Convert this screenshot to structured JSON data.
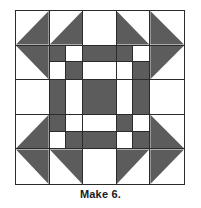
{
  "figure": {
    "caption": "Make 6.",
    "colors": {
      "dark_fabric": "#5c5c5c",
      "light_fabric": "#ffffff",
      "seam_line": "#2b2b2b",
      "background": "#ffffff"
    },
    "block": {
      "name": "quilt-block-diagram",
      "grid_rows": 5,
      "grid_columns": 5,
      "cells": [
        {
          "row": 1,
          "col": 1,
          "type": "half-square-triangle",
          "dark_corner": "bottom-right"
        },
        {
          "row": 1,
          "col": 2,
          "type": "half-square-triangle",
          "dark_corner": "bottom-right"
        },
        {
          "row": 1,
          "col": 3,
          "type": "plain",
          "value": "light"
        },
        {
          "row": 1,
          "col": 4,
          "type": "half-square-triangle",
          "dark_corner": "bottom-left"
        },
        {
          "row": 1,
          "col": 5,
          "type": "half-square-triangle",
          "dark_corner": "bottom-left"
        },
        {
          "row": 2,
          "col": 1,
          "type": "half-square-triangle",
          "dark_corner": "top-right"
        },
        {
          "row": 2,
          "col": 2,
          "type": "four-patch",
          "values": [
            "dark",
            "light",
            "light",
            "dark"
          ]
        },
        {
          "row": 2,
          "col": 3,
          "type": "split-vertical",
          "values": [
            "dark",
            "light"
          ]
        },
        {
          "row": 2,
          "col": 4,
          "type": "four-patch",
          "values": [
            "dark",
            "light",
            "light",
            "dark"
          ]
        },
        {
          "row": 2,
          "col": 5,
          "type": "half-square-triangle",
          "dark_corner": "top-left"
        },
        {
          "row": 3,
          "col": 1,
          "type": "plain",
          "value": "light"
        },
        {
          "row": 3,
          "col": 2,
          "type": "split-horizontal",
          "values": [
            "dark",
            "light"
          ]
        },
        {
          "row": 3,
          "col": 3,
          "type": "plain",
          "value": "dark"
        },
        {
          "row": 3,
          "col": 4,
          "type": "split-horizontal",
          "values": [
            "light",
            "dark"
          ]
        },
        {
          "row": 3,
          "col": 5,
          "type": "plain",
          "value": "light"
        },
        {
          "row": 4,
          "col": 1,
          "type": "half-square-triangle",
          "dark_corner": "bottom-right"
        },
        {
          "row": 4,
          "col": 2,
          "type": "four-patch",
          "values": [
            "dark",
            "light",
            "light",
            "dark"
          ]
        },
        {
          "row": 4,
          "col": 3,
          "type": "split-vertical",
          "values": [
            "light",
            "dark"
          ]
        },
        {
          "row": 4,
          "col": 4,
          "type": "four-patch",
          "values": [
            "dark",
            "light",
            "light",
            "dark"
          ]
        },
        {
          "row": 4,
          "col": 5,
          "type": "half-square-triangle",
          "dark_corner": "bottom-left"
        },
        {
          "row": 5,
          "col": 1,
          "type": "half-square-triangle",
          "dark_corner": "top-right"
        },
        {
          "row": 5,
          "col": 2,
          "type": "half-square-triangle",
          "dark_corner": "top-right"
        },
        {
          "row": 5,
          "col": 3,
          "type": "plain",
          "value": "light"
        },
        {
          "row": 5,
          "col": 4,
          "type": "half-square-triangle",
          "dark_corner": "top-left"
        },
        {
          "row": 5,
          "col": 5,
          "type": "half-square-triangle",
          "dark_corner": "top-left"
        }
      ]
    }
  }
}
